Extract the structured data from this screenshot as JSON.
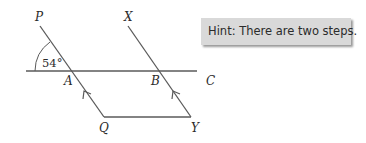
{
  "diagram": {
    "points": {
      "P": "P",
      "X": "X",
      "A": "A",
      "B": "B",
      "C": "C",
      "Q": "Q",
      "Y": "Y"
    },
    "angle_label": "54°",
    "colors": {
      "line": "#5a5a5a",
      "text": "#2b2b2b",
      "hint_bg": "#d9d9d9"
    }
  },
  "hint": {
    "text": "Hint: There are two steps."
  }
}
